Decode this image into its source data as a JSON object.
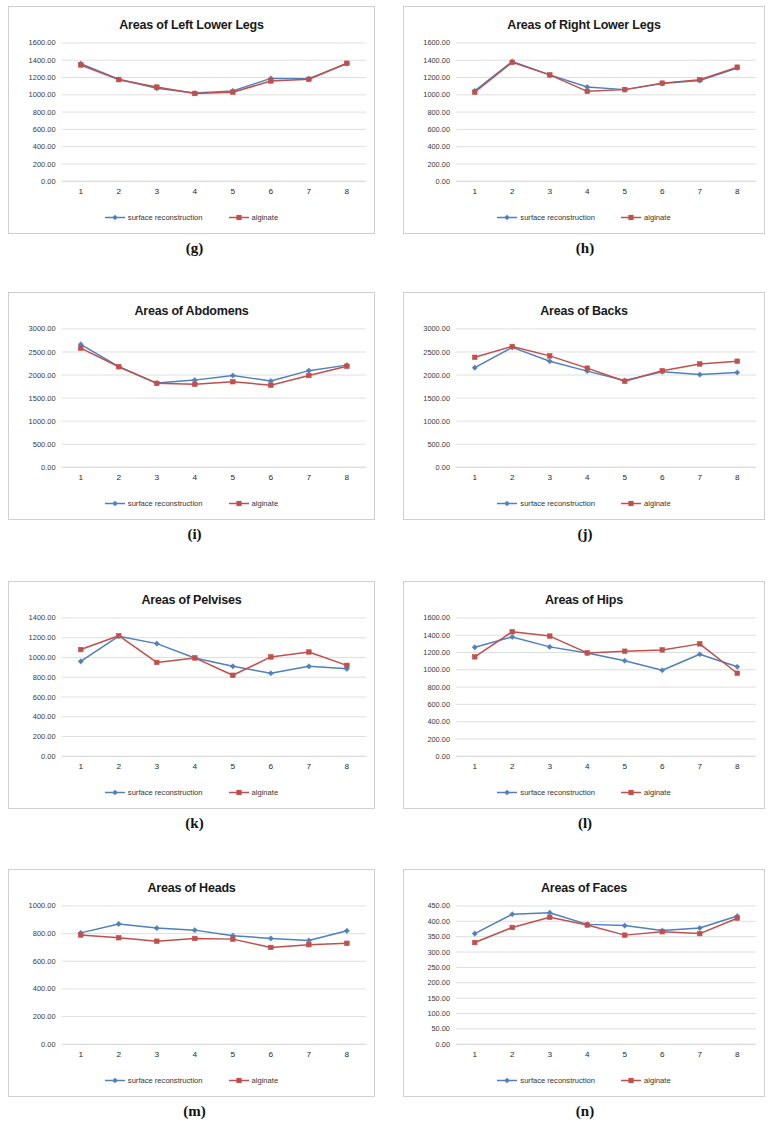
{
  "series_names": {
    "s1": "surface reconstruction",
    "s2": "alginate"
  },
  "colors": {
    "surface_reconstruction": "#4f81bd",
    "alginate": "#c0504d",
    "gridline": "#c9c9c9",
    "panel_border": "#d0d0d0",
    "text": "#1a1a1a"
  },
  "panels": [
    {
      "fig": "(g)",
      "chart_data": {
        "type": "line",
        "title": "Areas of Left Lower Legs",
        "xlabel": "",
        "ylabel": "",
        "categories": [
          "1",
          "2",
          "3",
          "4",
          "5",
          "6",
          "7",
          "8"
        ],
        "ylim": [
          0,
          1600
        ],
        "ytick_step": 200,
        "ytick_labels": [
          "0.00",
          "200.00",
          "400.00",
          "600.00",
          "800.00",
          "1000.00",
          "1200.00",
          "1400.00",
          "1600.00"
        ],
        "grid": true,
        "legend_position": "bottom",
        "series": [
          {
            "name": "surface reconstruction",
            "values": [
              1360,
              1180,
              1075,
              1020,
              1045,
              1190,
              1185,
              1360
            ]
          },
          {
            "name": "alginate",
            "values": [
              1345,
              1175,
              1090,
              1015,
              1030,
              1160,
              1180,
              1365
            ]
          }
        ]
      }
    },
    {
      "fig": "(h)",
      "chart_data": {
        "type": "line",
        "title": "Areas of Right Lower Legs",
        "xlabel": "",
        "ylabel": "",
        "categories": [
          "1",
          "2",
          "3",
          "4",
          "5",
          "6",
          "7",
          "8"
        ],
        "ylim": [
          0,
          1600
        ],
        "ytick_step": 200,
        "ytick_labels": [
          "0.00",
          "200.00",
          "400.00",
          "600.00",
          "800.00",
          "1000.00",
          "1200.00",
          "1400.00",
          "1600.00"
        ],
        "grid": true,
        "legend_position": "bottom",
        "series": [
          {
            "name": "surface reconstruction",
            "values": [
              1045,
              1385,
              1230,
              1090,
              1060,
              1130,
              1165,
              1310
            ]
          },
          {
            "name": "alginate",
            "values": [
              1030,
              1375,
              1230,
              1040,
              1060,
              1135,
              1175,
              1320
            ]
          }
        ]
      }
    },
    {
      "fig": "(i)",
      "chart_data": {
        "type": "line",
        "title": "Areas of Abdomens",
        "xlabel": "",
        "ylabel": "",
        "categories": [
          "1",
          "2",
          "3",
          "4",
          "5",
          "6",
          "7",
          "8"
        ],
        "ylim": [
          0,
          3000
        ],
        "ytick_step": 500,
        "ytick_labels": [
          "0.00",
          "500.00",
          "1000.00",
          "1500.00",
          "2000.00",
          "2500.00",
          "3000.00"
        ],
        "grid": true,
        "legend_position": "bottom",
        "series": [
          {
            "name": "surface reconstruction",
            "values": [
              2665,
              2180,
              1825,
              1890,
              1990,
              1870,
              2095,
              2215
            ]
          },
          {
            "name": "alginate",
            "values": [
              2585,
              2180,
              1820,
              1800,
              1855,
              1780,
              1990,
              2190
            ]
          }
        ]
      }
    },
    {
      "fig": "(j)",
      "chart_data": {
        "type": "line",
        "title": "Areas of Backs",
        "xlabel": "",
        "ylabel": "",
        "categories": [
          "1",
          "2",
          "3",
          "4",
          "5",
          "6",
          "7",
          "8"
        ],
        "ylim": [
          0,
          3000
        ],
        "ytick_step": 500,
        "ytick_labels": [
          "0.00",
          "500.00",
          "1000.00",
          "1500.00",
          "2000.00",
          "2500.00",
          "3000.00"
        ],
        "grid": true,
        "legend_position": "bottom",
        "series": [
          {
            "name": "surface reconstruction",
            "values": [
              2160,
              2600,
              2300,
              2085,
              1880,
              2070,
              2010,
              2055
            ]
          },
          {
            "name": "alginate",
            "values": [
              2385,
              2620,
              2415,
              2150,
              1865,
              2095,
              2240,
              2300
            ]
          }
        ]
      }
    },
    {
      "fig": "(k)",
      "chart_data": {
        "type": "line",
        "title": "Areas of Pelvises",
        "xlabel": "",
        "ylabel": "",
        "categories": [
          "1",
          "2",
          "3",
          "4",
          "5",
          "6",
          "7",
          "8"
        ],
        "ylim": [
          0,
          1400
        ],
        "ytick_step": 200,
        "ytick_labels": [
          "0.00",
          "200.00",
          "400.00",
          "600.00",
          "800.00",
          "1000.00",
          "1200.00",
          "1400.00"
        ],
        "grid": true,
        "legend_position": "bottom",
        "series": [
          {
            "name": "surface reconstruction",
            "values": [
              960,
              1215,
              1140,
              995,
              910,
              840,
              910,
              885
            ]
          },
          {
            "name": "alginate",
            "values": [
              1080,
              1220,
              950,
              995,
              820,
              1005,
              1055,
              920
            ]
          }
        ]
      }
    },
    {
      "fig": "(l)",
      "chart_data": {
        "type": "line",
        "title": "Areas of Hips",
        "xlabel": "",
        "ylabel": "",
        "categories": [
          "1",
          "2",
          "3",
          "4",
          "5",
          "6",
          "7",
          "8"
        ],
        "ylim": [
          0,
          1600
        ],
        "ytick_step": 200,
        "ytick_labels": [
          "0.00",
          "200.00",
          "400.00",
          "600.00",
          "800.00",
          "1000.00",
          "1200.00",
          "1400.00",
          "1600.00"
        ],
        "grid": true,
        "legend_position": "bottom",
        "series": [
          {
            "name": "surface reconstruction",
            "values": [
              1260,
              1380,
              1265,
              1195,
              1105,
              995,
              1180,
              1035
            ]
          },
          {
            "name": "alginate",
            "values": [
              1150,
              1440,
              1390,
              1195,
              1215,
              1230,
              1300,
              960
            ]
          }
        ]
      }
    },
    {
      "fig": "(m)",
      "chart_data": {
        "type": "line",
        "title": "Areas of Heads",
        "xlabel": "",
        "ylabel": "",
        "categories": [
          "1",
          "2",
          "3",
          "4",
          "5",
          "6",
          "7",
          "8"
        ],
        "ylim": [
          0,
          1000
        ],
        "ytick_step": 200,
        "ytick_labels": [
          "0.00",
          "200.00",
          "400.00",
          "600.00",
          "800.00",
          "1000.00"
        ],
        "grid": true,
        "legend_position": "bottom",
        "series": [
          {
            "name": "surface reconstruction",
            "values": [
              805,
              870,
              840,
              825,
              785,
              765,
              750,
              820
            ]
          },
          {
            "name": "alginate",
            "values": [
              790,
              770,
              745,
              765,
              760,
              700,
              720,
              730
            ]
          }
        ]
      }
    },
    {
      "fig": "(n)",
      "chart_data": {
        "type": "line",
        "title": "Areas of Faces",
        "xlabel": "",
        "ylabel": "",
        "categories": [
          "1",
          "2",
          "3",
          "4",
          "5",
          "6",
          "7",
          "8"
        ],
        "ylim": [
          0,
          450
        ],
        "ytick_step": 50,
        "ytick_labels": [
          "0.00",
          "50.00",
          "100.00",
          "150.00",
          "200.00",
          "250.00",
          "300.00",
          "350.00",
          "400.00",
          "450.00"
        ],
        "grid": true,
        "legend_position": "bottom",
        "series": [
          {
            "name": "surface reconstruction",
            "values": [
              360,
              423,
              428,
              390,
              386,
              370,
              378,
              417
            ]
          },
          {
            "name": "alginate",
            "values": [
              331,
              380,
              413,
              388,
              355,
              366,
              360,
              410
            ]
          }
        ]
      }
    }
  ]
}
